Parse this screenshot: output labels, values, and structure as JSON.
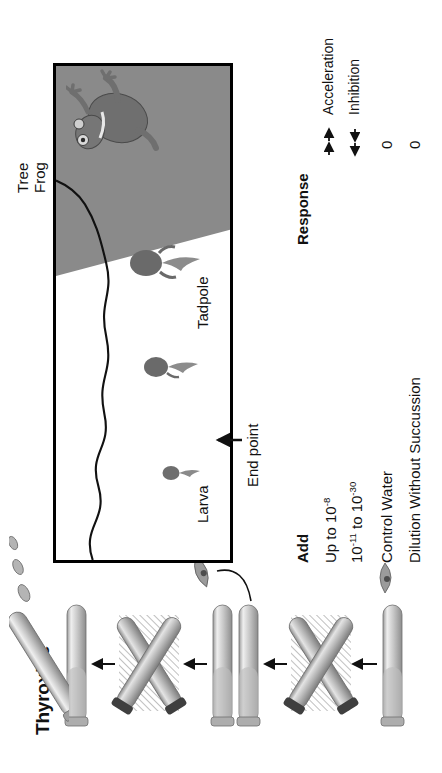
{
  "figure": {
    "title": "Thyroxine",
    "endpoint_label": "End point",
    "organisms": [
      {
        "name": "larva-label",
        "label": "Larva"
      },
      {
        "name": "tadpole-label",
        "label": "Tadpole"
      },
      {
        "name": "treefrog-label",
        "label": "Tree\nFrog",
        "line1": "Tree",
        "line2": "Frog"
      }
    ]
  },
  "table": {
    "columns": [
      {
        "key": "add",
        "header": "Add"
      },
      {
        "key": "response",
        "header": "Response"
      }
    ],
    "rows": [
      {
        "add_prefix": "Up to 10",
        "add_sup": "-8",
        "add_mid": "",
        "add_sup2": "",
        "response_type": "acceleration",
        "response_text": "",
        "response_label": "Acceleration"
      },
      {
        "add_prefix": "10",
        "add_sup": "-11",
        "add_mid": " to 10",
        "add_sup2": "-30",
        "response_type": "inhibition",
        "response_text": "",
        "response_label": "Inhibition"
      },
      {
        "add_prefix": "Control Water",
        "add_sup": "",
        "add_mid": "",
        "add_sup2": "",
        "response_type": "zero",
        "response_text": "0",
        "response_label": ""
      },
      {
        "add_prefix": "Dilution Without Succussion",
        "add_sup": "",
        "add_mid": "",
        "add_sup2": "",
        "response_type": "zero",
        "response_text": "0",
        "response_label": ""
      }
    ],
    "legend": {
      "acceleration_label": "Acceleration",
      "inhibition_label": "Inhibition"
    }
  },
  "colors": {
    "land_gray": "#8a8a8a",
    "frame_gray": "#8c8c8c",
    "ink": "#111111",
    "tube_gray_light": "#d6d6d6",
    "tube_gray_dark": "#8f8f8f"
  },
  "icons": {
    "dropper": "dropper-icon",
    "test_tube": "test-tube-icon",
    "succussion_cross": "succussion-cross-icon",
    "pouring_tube": "pouring-tube-icon",
    "droplet": "droplet-icon",
    "tadpole": "tadpole-icon",
    "larva": "larva-icon",
    "frog": "frog-icon",
    "arrow_up": "arrow-up-icon",
    "arrow_left": "arrow-left-icon"
  }
}
